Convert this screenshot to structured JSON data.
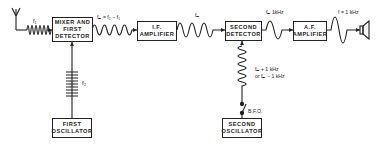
{
  "diagram": {
    "blocks": {
      "mixer": "MIXER AND FIRST DETECTOR",
      "if_amp": "I.F. AMPLIFIER",
      "second_detector": "SECOND DETECTOR",
      "af_amp": "A.F. AMPLIFIER",
      "first_osc": "FIRST OSCILLATOR",
      "second_osc": "SECOND OSCILLATOR"
    },
    "labels": {
      "f1": "f₁",
      "f2": "f₂",
      "fm_eq": "fₘ = f₂ − f₁",
      "fm": "fₘ",
      "fm_1khz": "fₘ 1kHz",
      "f_1khz": "f = 1 kHz",
      "bfo_freq_line1": "fₘ + 1 kHz",
      "bfo_freq_line2": "or  fₘ − 1 kHz",
      "bfo": "B.F.O."
    },
    "colors": {
      "line": "#222222",
      "background": "#ffffff"
    }
  }
}
